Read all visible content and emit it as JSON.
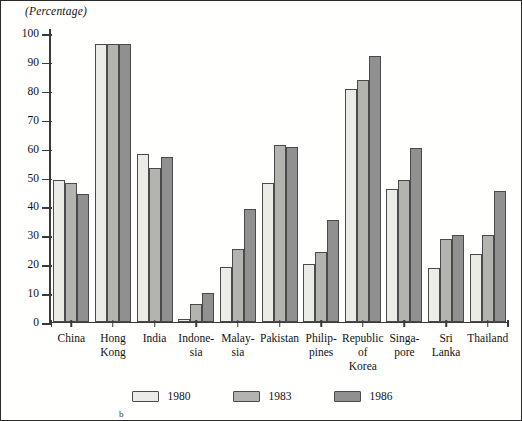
{
  "axis": {
    "unit_caption": "(Percentage)",
    "y_ticks": [
      0,
      10,
      20,
      30,
      40,
      50,
      60,
      70,
      80,
      90,
      100
    ]
  },
  "legend": {
    "items": [
      {
        "label": "1980",
        "color": "#ebebe7",
        "key": "y1980"
      },
      {
        "label": "1983",
        "color": "#b3b3af",
        "key": "y1983"
      },
      {
        "label": "1986",
        "color": "#909090",
        "key": "y1986"
      }
    ]
  },
  "footnote": "b",
  "chart_data": {
    "type": "bar",
    "title": "",
    "subtitle": "",
    "xlabel": "",
    "ylabel": "(Percentage)",
    "ylim": [
      0,
      100
    ],
    "y_ticks": [
      0,
      10,
      20,
      30,
      40,
      50,
      60,
      70,
      80,
      90,
      100
    ],
    "grid": false,
    "legend_position": "bottom-center",
    "categories": [
      "China",
      "Hong Kong",
      "India",
      "Indonesia",
      "Malaysia",
      "Pakistan",
      "Philippines",
      "Republic of Korea",
      "Singapore",
      "Sri Lanka",
      "Thailand"
    ],
    "category_label_lines": [
      [
        "China"
      ],
      [
        "Hong",
        "Kong"
      ],
      [
        "India"
      ],
      [
        "Indone-",
        "sia"
      ],
      [
        "Malay-",
        "sia"
      ],
      [
        "Pakistan"
      ],
      [
        "Philip-",
        "pines"
      ],
      [
        "Republic",
        "of",
        "Korea"
      ],
      [
        "Singa-",
        "pore"
      ],
      [
        "Sri Lanka"
      ],
      [
        "Thailand"
      ]
    ],
    "series": [
      {
        "name": "1980",
        "color": "#ebebe7",
        "values": [
          49,
          96,
          58,
          1,
          19,
          48,
          20,
          80.5,
          46,
          18.5,
          23.5
        ]
      },
      {
        "name": "1983",
        "color": "#b3b3af",
        "values": [
          48,
          96,
          53,
          6,
          25,
          61,
          24,
          83.5,
          49,
          28.5,
          30
        ]
      },
      {
        "name": "1986",
        "color": "#909090",
        "values": [
          44,
          96,
          57,
          10,
          39,
          60.5,
          35,
          92,
          60,
          30,
          45
        ]
      }
    ]
  }
}
